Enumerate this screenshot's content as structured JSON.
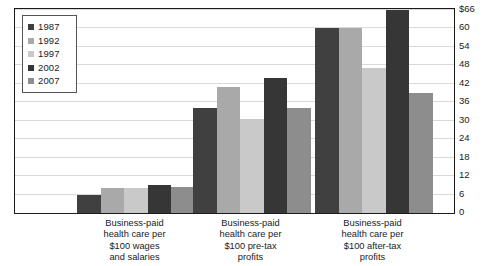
{
  "chart_data": {
    "type": "bar",
    "title": "",
    "xlabel": "",
    "ylabel": "",
    "ylim": [
      0,
      66
    ],
    "grid": true,
    "legend_position": "top-left",
    "categories": [
      "Business-paid health care per $100 wages and salaries",
      "Business-paid health care per $100 pre-tax profits",
      "Business-paid health care per $100 after-tax profits"
    ],
    "category_lines": [
      [
        "Business-paid",
        "health care per",
        "$100 wages",
        "and salaries"
      ],
      [
        "Business-paid",
        "health care per",
        "$100 pre-tax",
        "profits"
      ],
      [
        "Business-paid",
        "health care per",
        "$100 after-tax",
        "profits"
      ]
    ],
    "series": [
      {
        "name": "1987",
        "color": "#404040",
        "values": [
          6.0,
          34.0,
          60.0
        ]
      },
      {
        "name": "1992",
        "color": "#a9a9a9",
        "values": [
          8.0,
          41.0,
          60.0
        ]
      },
      {
        "name": "1997",
        "color": "#c9c9c9",
        "values": [
          8.0,
          30.5,
          47.0
        ]
      },
      {
        "name": "2002",
        "color": "#363636",
        "values": [
          9.0,
          44.0,
          66.0
        ]
      },
      {
        "name": "2007",
        "color": "#8d8d8d",
        "values": [
          8.5,
          34.0,
          39.0
        ]
      }
    ],
    "yticks": [
      {
        "value": 66,
        "label": "$66"
      },
      {
        "value": 60,
        "label": "60"
      },
      {
        "value": 54,
        "label": "54"
      },
      {
        "value": 48,
        "label": "48"
      },
      {
        "value": 42,
        "label": "42"
      },
      {
        "value": 36,
        "label": "36"
      },
      {
        "value": 30,
        "label": "30"
      },
      {
        "value": 24,
        "label": "24"
      },
      {
        "value": 18,
        "label": "18"
      },
      {
        "value": 12,
        "label": "12"
      },
      {
        "value": 6,
        "label": "6"
      },
      {
        "value": 0,
        "label": "0"
      }
    ]
  },
  "legend": {
    "items": [
      {
        "label": "1987",
        "color": "#404040"
      },
      {
        "label": "1992",
        "color": "#a9a9a9"
      },
      {
        "label": "1997",
        "color": "#c9c9c9"
      },
      {
        "label": "2002",
        "color": "#363636"
      },
      {
        "label": "2007",
        "color": "#8d8d8d"
      }
    ]
  }
}
